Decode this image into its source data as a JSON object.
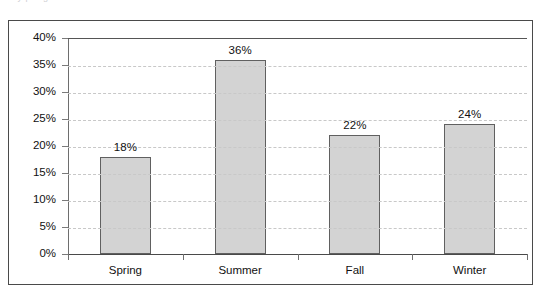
{
  "top_cut_text": "a e y p e g",
  "colors": {
    "bar_fill": "#d3d3d3",
    "bar_border": "#606060",
    "gridline": "#c8c8c8",
    "axis": "#4a4a4a",
    "frame": "#4a4a4a",
    "text": "#111111",
    "background": "#ffffff"
  },
  "chart_data": {
    "type": "bar",
    "title": "",
    "xlabel": "",
    "ylabel": "",
    "categories": [
      "Spring",
      "Summer",
      "Fall",
      "Winter"
    ],
    "values": [
      18,
      36,
      22,
      24
    ],
    "value_labels": [
      "18%",
      "36%",
      "22%",
      "24%"
    ],
    "ylim": [
      0,
      40
    ],
    "ytick_values": [
      0,
      5,
      10,
      15,
      20,
      25,
      30,
      35,
      40
    ],
    "ytick_labels": [
      "0%",
      "5%",
      "10%",
      "15%",
      "20%",
      "25%",
      "30%",
      "35%",
      "40%"
    ],
    "grid": true,
    "grid_axis": "y",
    "grid_style": "dashed",
    "legend": false,
    "legend_position": "none",
    "orientation": "vertical",
    "units": "percent"
  }
}
